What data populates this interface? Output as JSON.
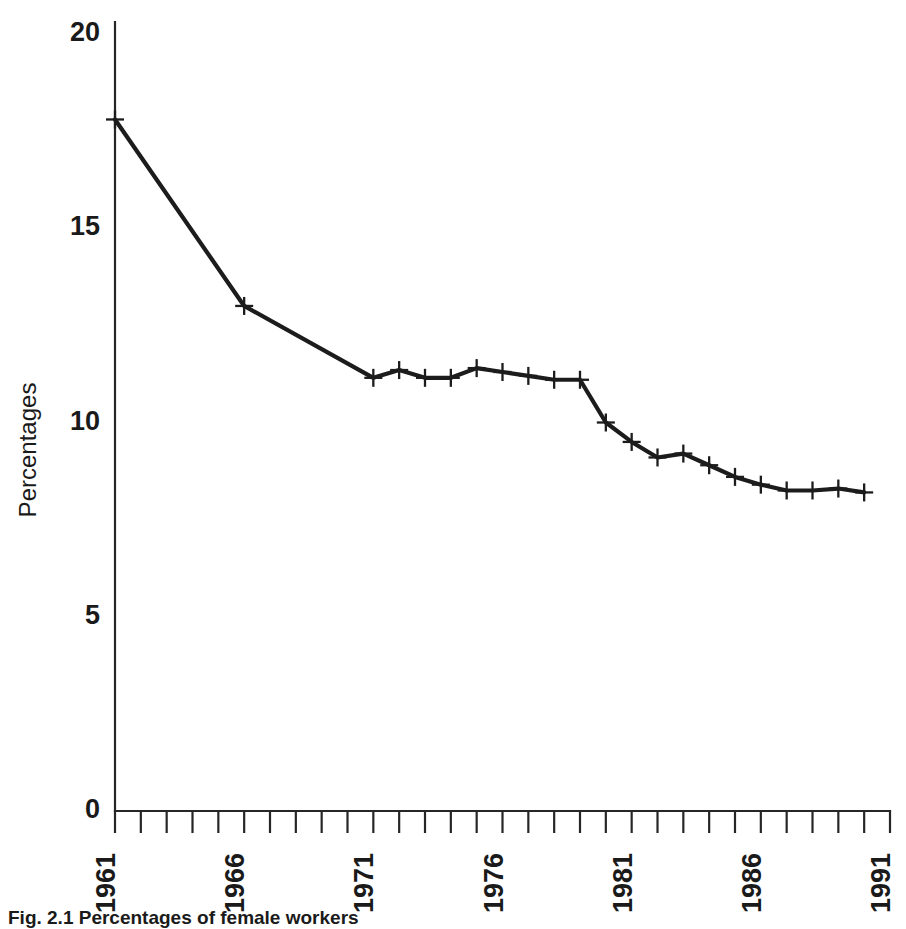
{
  "chart_data": {
    "type": "line",
    "title": "",
    "xlabel": "",
    "ylabel": "Percentages",
    "xlim": [
      1961,
      1991
    ],
    "ylim": [
      0,
      20
    ],
    "grid": false,
    "legend": null,
    "y_ticks": [
      0,
      5,
      10,
      15,
      20
    ],
    "y_tick_labels": [
      "0",
      "5",
      "10",
      "15",
      "20"
    ],
    "x_ticks": [
      1961,
      1962,
      1963,
      1964,
      1965,
      1966,
      1967,
      1968,
      1969,
      1970,
      1971,
      1972,
      1973,
      1974,
      1975,
      1976,
      1977,
      1978,
      1979,
      1980,
      1981,
      1982,
      1983,
      1984,
      1985,
      1986,
      1987,
      1988,
      1989,
      1990,
      1991
    ],
    "x_tick_labels": [
      "1961",
      "1966",
      "1971",
      "1976",
      "1981",
      "1986",
      "1991"
    ],
    "x_labelled_ticks": [
      1961,
      1966,
      1971,
      1976,
      1981,
      1986,
      1991
    ],
    "marker": "plus",
    "series": [
      {
        "name": "Percentages",
        "x": [
          1961,
          1966,
          1971,
          1972,
          1973,
          1974,
          1975,
          1976,
          1977,
          1978,
          1979,
          1980,
          1981,
          1982,
          1983,
          1984,
          1985,
          1986,
          1987,
          1988,
          1989,
          1990
        ],
        "values": [
          17.8,
          13.0,
          11.15,
          11.35,
          11.15,
          11.15,
          11.4,
          11.3,
          11.2,
          11.1,
          11.1,
          10.0,
          9.5,
          9.1,
          9.2,
          8.9,
          8.6,
          8.4,
          8.25,
          8.25,
          8.3,
          8.2
        ]
      }
    ]
  },
  "figure": {
    "caption": "Fig. 2.1 Percentages of female workers"
  }
}
